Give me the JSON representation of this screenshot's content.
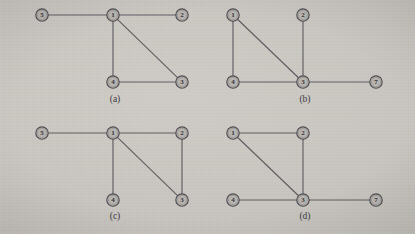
{
  "figure": {
    "background_color": "#cbc8c3",
    "node_fill_color": "#b8b5b0",
    "node_stroke_color": "#4e4c51",
    "edge_color": "#56545a",
    "label_color": "#35333a"
  },
  "panels": [
    {
      "caption": "(a)",
      "caption_pos": {
        "x": 115,
        "y": 99
      },
      "nodes": [
        {
          "id": "n5",
          "label": "5",
          "x": 42,
          "y": 15,
          "r": 6.2
        },
        {
          "id": "n1",
          "label": "1",
          "x": 113,
          "y": 15,
          "r": 6.2
        },
        {
          "id": "n2",
          "label": "2",
          "x": 182,
          "y": 15,
          "r": 6.2
        },
        {
          "id": "n4",
          "label": "4",
          "x": 113,
          "y": 82,
          "r": 6.2
        },
        {
          "id": "n3",
          "label": "3",
          "x": 182,
          "y": 82,
          "r": 6.2
        }
      ],
      "edges": [
        {
          "from": "n5",
          "to": "n1"
        },
        {
          "from": "n1",
          "to": "n2"
        },
        {
          "from": "n1",
          "to": "n4"
        },
        {
          "from": "n1",
          "to": "n3"
        },
        {
          "from": "n4",
          "to": "n3"
        }
      ]
    },
    {
      "caption": "(b)",
      "caption_pos": {
        "x": 305,
        "y": 99
      },
      "nodes": [
        {
          "id": "n1",
          "label": "1",
          "x": 233,
          "y": 15,
          "r": 6.2
        },
        {
          "id": "n2",
          "label": "2",
          "x": 303,
          "y": 15,
          "r": 6.2
        },
        {
          "id": "n4",
          "label": "4",
          "x": 233,
          "y": 82,
          "r": 6.2
        },
        {
          "id": "n3",
          "label": "3",
          "x": 303,
          "y": 82,
          "r": 6.2
        },
        {
          "id": "n7",
          "label": "7",
          "x": 376,
          "y": 82,
          "r": 6.2
        }
      ],
      "edges": [
        {
          "from": "n1",
          "to": "n4"
        },
        {
          "from": "n1",
          "to": "n3"
        },
        {
          "from": "n2",
          "to": "n3"
        },
        {
          "from": "n4",
          "to": "n3"
        },
        {
          "from": "n3",
          "to": "n7"
        }
      ]
    },
    {
      "caption": "(c)",
      "caption_pos": {
        "x": 115,
        "y": 216
      },
      "nodes": [
        {
          "id": "n5",
          "label": "5",
          "x": 42,
          "y": 133,
          "r": 6.2
        },
        {
          "id": "n1",
          "label": "1",
          "x": 113,
          "y": 133,
          "r": 6.2
        },
        {
          "id": "n2",
          "label": "2",
          "x": 182,
          "y": 133,
          "r": 6.2
        },
        {
          "id": "n4",
          "label": "4",
          "x": 113,
          "y": 200,
          "r": 6.2
        },
        {
          "id": "n3",
          "label": "3",
          "x": 182,
          "y": 200,
          "r": 6.2
        }
      ],
      "edges": [
        {
          "from": "n5",
          "to": "n1"
        },
        {
          "from": "n1",
          "to": "n2"
        },
        {
          "from": "n1",
          "to": "n4"
        },
        {
          "from": "n1",
          "to": "n3"
        },
        {
          "from": "n2",
          "to": "n3"
        }
      ]
    },
    {
      "caption": "(d)",
      "caption_pos": {
        "x": 305,
        "y": 216
      },
      "nodes": [
        {
          "id": "n1",
          "label": "1",
          "x": 233,
          "y": 133,
          "r": 6.2
        },
        {
          "id": "n2",
          "label": "2",
          "x": 303,
          "y": 133,
          "r": 6.2
        },
        {
          "id": "n4",
          "label": "4",
          "x": 233,
          "y": 200,
          "r": 6.2
        },
        {
          "id": "n3",
          "label": "3",
          "x": 303,
          "y": 200,
          "r": 6.2
        },
        {
          "id": "n7",
          "label": "7",
          "x": 376,
          "y": 200,
          "r": 6.2
        }
      ],
      "edges": [
        {
          "from": "n1",
          "to": "n2"
        },
        {
          "from": "n1",
          "to": "n3"
        },
        {
          "from": "n2",
          "to": "n3"
        },
        {
          "from": "n4",
          "to": "n3"
        },
        {
          "from": "n3",
          "to": "n7"
        }
      ]
    }
  ]
}
